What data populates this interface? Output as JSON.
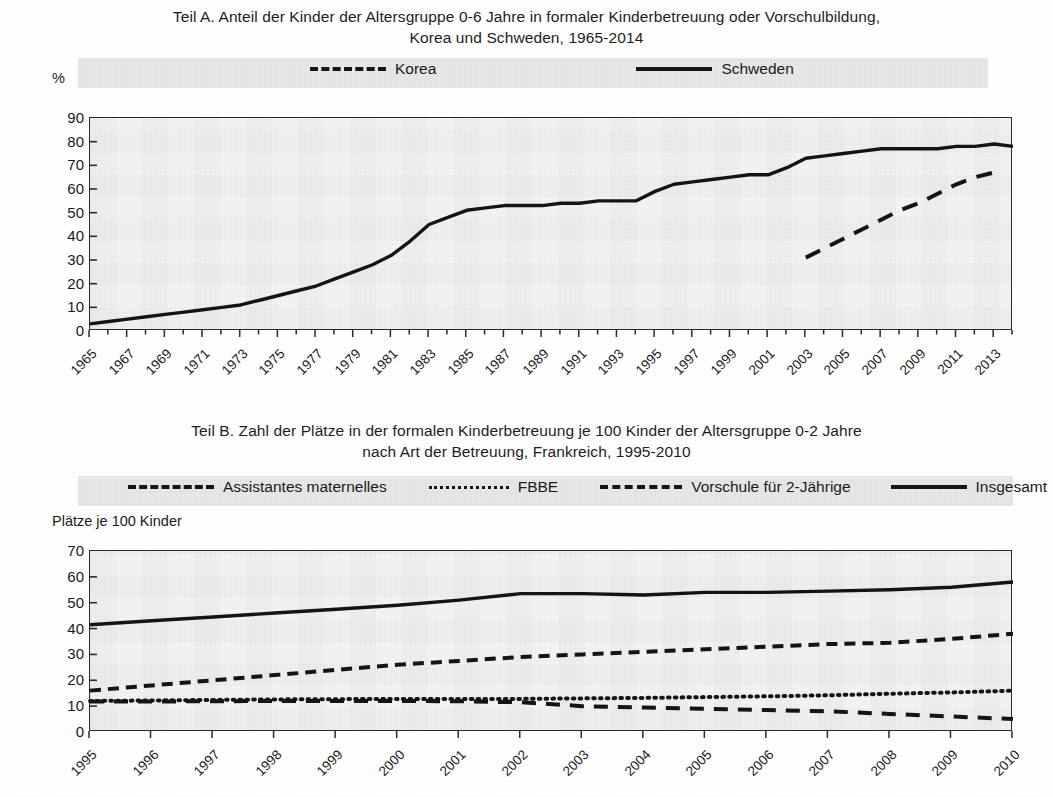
{
  "panel_a": {
    "title_line1": "Teil A. Anteil der Kinder der Altersgruppe 0-6 Jahre in formaler Kinderbetreuung oder Vorschulbildung,",
    "title_line2": "Korea und Schweden, 1965-2014",
    "y_unit": "%",
    "legend": [
      {
        "label": "Korea",
        "style": "dashed"
      },
      {
        "label": "Schweden",
        "style": "solid"
      }
    ]
  },
  "panel_b": {
    "title_line1": "Teil B. Zahl der Plätze in der formalen Kinderbetreuung je 100 Kinder der Altersgruppe 0-2 Jahre",
    "title_line2": "nach Art der Betreuung, Frankreich, 1995-2010",
    "y_unit": "Plätze je 100 Kinder",
    "legend": [
      {
        "label": "Assistantes maternelles",
        "style": "dashed-short"
      },
      {
        "label": "FBBE",
        "style": "dotted"
      },
      {
        "label": "Vorschule für 2-Jährige",
        "style": "dashed-long"
      },
      {
        "label": "Insgesamt",
        "style": "solid"
      }
    ]
  },
  "chart_data": [
    {
      "type": "line",
      "id": "teil-a",
      "title": "Teil A. Anteil der Kinder der Altersgruppe 0-6 Jahre in formaler Kinderbetreuung oder Vorschulbildung, Korea und Schweden, 1965-2014",
      "xlabel": "",
      "ylabel": "%",
      "ylim": [
        0,
        90
      ],
      "yticks": [
        0,
        10,
        20,
        30,
        40,
        50,
        60,
        70,
        80,
        90
      ],
      "xlim": [
        1965,
        2014
      ],
      "xticks": [
        1965,
        1967,
        1969,
        1971,
        1973,
        1975,
        1977,
        1979,
        1981,
        1983,
        1985,
        1987,
        1989,
        1991,
        1993,
        1995,
        1997,
        1999,
        2001,
        2003,
        2005,
        2007,
        2009,
        2011,
        2013
      ],
      "grid": false,
      "legend_position": "top",
      "series": [
        {
          "name": "Schweden",
          "style": "solid",
          "x": [
            1965,
            1966,
            1967,
            1968,
            1969,
            1970,
            1971,
            1972,
            1973,
            1974,
            1975,
            1976,
            1977,
            1978,
            1979,
            1980,
            1981,
            1982,
            1983,
            1984,
            1985,
            1986,
            1987,
            1988,
            1989,
            1990,
            1991,
            1992,
            1993,
            1994,
            1995,
            1996,
            1997,
            1998,
            1999,
            2000,
            2001,
            2002,
            2003,
            2004,
            2005,
            2006,
            2007,
            2008,
            2009,
            2010,
            2011,
            2012,
            2013,
            2014
          ],
          "values": [
            3,
            4,
            5,
            6,
            7,
            8,
            9,
            10,
            11,
            13,
            15,
            17,
            19,
            22,
            25,
            28,
            32,
            38,
            45,
            48,
            51,
            52,
            53,
            53,
            53,
            54,
            54,
            55,
            55,
            55,
            59,
            62,
            63,
            64,
            65,
            66,
            66,
            69,
            73,
            74,
            75,
            76,
            77,
            77,
            77,
            77,
            78,
            78,
            79,
            78
          ]
        },
        {
          "name": "Korea",
          "style": "dashed",
          "x": [
            2003,
            2004,
            2005,
            2006,
            2007,
            2008,
            2009,
            2010,
            2011,
            2012,
            2013
          ],
          "values": [
            31,
            35,
            39,
            43,
            47,
            51,
            54,
            58,
            62,
            65,
            67
          ]
        }
      ]
    },
    {
      "type": "line",
      "id": "teil-b",
      "title": "Teil B. Zahl der Plätze in der formalen Kinderbetreuung je 100 Kinder der Altersgruppe 0-2 Jahre nach Art der Betreuung, Frankreich, 1995-2010",
      "xlabel": "",
      "ylabel": "Plätze je 100 Kinder",
      "ylim": [
        0,
        70
      ],
      "yticks": [
        0,
        10,
        20,
        30,
        40,
        50,
        60,
        70
      ],
      "xlim": [
        1995,
        2010
      ],
      "xticks": [
        1995,
        1996,
        1997,
        1998,
        1999,
        2000,
        2001,
        2002,
        2003,
        2004,
        2005,
        2006,
        2007,
        2008,
        2009,
        2010
      ],
      "grid": false,
      "legend_position": "top",
      "series": [
        {
          "name": "Insgesamt",
          "style": "solid",
          "x": [
            1995,
            1996,
            1997,
            1998,
            1999,
            2000,
            2001,
            2002,
            2003,
            2004,
            2005,
            2006,
            2007,
            2008,
            2009,
            2010
          ],
          "values": [
            41.5,
            43,
            44.5,
            46,
            47.5,
            49,
            51,
            53.5,
            53.5,
            53,
            54,
            54,
            54.5,
            55,
            56,
            58
          ]
        },
        {
          "name": "Assistantes maternelles",
          "style": "dashed-short",
          "x": [
            1995,
            1996,
            1997,
            1998,
            1999,
            2000,
            2001,
            2002,
            2003,
            2004,
            2005,
            2006,
            2007,
            2008,
            2009,
            2010
          ],
          "values": [
            16,
            18,
            20,
            22,
            24,
            26,
            27.5,
            29,
            30,
            31,
            32,
            33,
            34,
            34.5,
            36,
            38
          ]
        },
        {
          "name": "FBBE",
          "style": "dotted",
          "x": [
            1995,
            1996,
            1997,
            1998,
            1999,
            2000,
            2001,
            2002,
            2003,
            2004,
            2005,
            2006,
            2007,
            2008,
            2009,
            2010
          ],
          "values": [
            12,
            12.2,
            12.4,
            12.6,
            12.7,
            12.8,
            12.8,
            12.8,
            13,
            13.2,
            13.5,
            13.8,
            14.2,
            14.8,
            15.3,
            16
          ]
        },
        {
          "name": "Vorschule für 2-Jährige",
          "style": "dashed-long",
          "x": [
            1995,
            1996,
            1997,
            1998,
            1999,
            2000,
            2001,
            2002,
            2003,
            2004,
            2005,
            2006,
            2007,
            2008,
            2009,
            2010
          ],
          "values": [
            11.8,
            11.8,
            11.9,
            12,
            12,
            12,
            11.9,
            11.5,
            10,
            9.5,
            9,
            8.5,
            8,
            7,
            6,
            5
          ]
        }
      ]
    }
  ]
}
